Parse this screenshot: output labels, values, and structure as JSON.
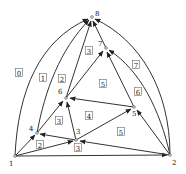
{
  "diagram": {
    "type": "directed planar graph with face labels",
    "colors": {
      "edge": "#333333",
      "text": "#222222",
      "background": "#ffffff"
    },
    "nodes": [
      {
        "id": "1",
        "label": "1",
        "x": 15,
        "y": 156,
        "lx": 9,
        "ly": 166
      },
      {
        "id": "2",
        "label": "2",
        "x": 170,
        "y": 155,
        "lx": 172,
        "ly": 165
      },
      {
        "id": "3",
        "label": "3",
        "x": 76,
        "y": 140,
        "lx": 76,
        "ly": 134
      },
      {
        "id": "4",
        "label": "4",
        "x": 37,
        "y": 133,
        "lx": 29,
        "ly": 131
      },
      {
        "id": "5",
        "label": "5",
        "x": 134,
        "y": 107,
        "lx": 132,
        "ly": 116
      },
      {
        "id": "6",
        "label": "6",
        "x": 66,
        "y": 98,
        "lx": 58,
        "ly": 94
      },
      {
        "id": "7",
        "label": "7",
        "x": 106,
        "y": 48,
        "lx": 98,
        "ly": 46
      },
      {
        "id": "8",
        "label": "8",
        "x": 92,
        "y": 17,
        "lx": 95,
        "ly": 16
      }
    ],
    "edges": [
      {
        "from": "1",
        "to": "8",
        "d": "M15,156 C18,90 40,40 88,19"
      },
      {
        "from": "1",
        "to": "4",
        "d": "M15,156 L35,135"
      },
      {
        "from": "1",
        "to": "3",
        "d": "M15,156 L73,141"
      },
      {
        "from": "1",
        "to": "2",
        "d": "M15,156 L167,155"
      },
      {
        "from": "4",
        "to": "8",
        "d": "M37,133 C45,90 60,50 89,20"
      },
      {
        "from": "4",
        "to": "6",
        "d": "M37,133 L63,101"
      },
      {
        "from": "3",
        "to": "4",
        "d": "M76,140 L40,134"
      },
      {
        "from": "3",
        "to": "6",
        "d": "M76,140 L67,102"
      },
      {
        "from": "3",
        "to": "5",
        "d": "M76,140 L131,109"
      },
      {
        "from": "2",
        "to": "3",
        "d": "M170,155 L80,141"
      },
      {
        "from": "2",
        "to": "5",
        "d": "M170,155 L137,110"
      },
      {
        "from": "2",
        "to": "7",
        "d": "M170,155 C160,110 140,70 109,50"
      },
      {
        "from": "2",
        "to": "8",
        "d": "M170,155 C170,90 140,40 95,19"
      },
      {
        "from": "5",
        "to": "6",
        "d": "M134,107 L70,98"
      },
      {
        "from": "5",
        "to": "7",
        "d": "M134,107 L107,52"
      },
      {
        "from": "6",
        "to": "8",
        "d": "M66,98 L91,21"
      },
      {
        "from": "6",
        "to": "7",
        "d": "M66,98 L103,51"
      },
      {
        "from": "7",
        "to": "8",
        "d": "M106,48 L93,21"
      }
    ],
    "faces": [
      {
        "label": "0",
        "x": 19,
        "y": 73
      },
      {
        "label": "1",
        "x": 43,
        "y": 78
      },
      {
        "label": "2",
        "x": 62,
        "y": 79
      },
      {
        "label": "3",
        "x": 89,
        "y": 51
      },
      {
        "label": "7",
        "x": 136,
        "y": 65
      },
      {
        "label": "5",
        "x": 103,
        "y": 84
      },
      {
        "label": "6",
        "x": 138,
        "y": 92
      },
      {
        "label": "4",
        "x": 89,
        "y": 116
      },
      {
        "label": "3",
        "x": 59,
        "y": 121
      },
      {
        "label": "5",
        "x": 121,
        "y": 132
      },
      {
        "label": "2",
        "x": 40,
        "y": 145
      },
      {
        "label": "3",
        "x": 78,
        "y": 148
      }
    ]
  }
}
